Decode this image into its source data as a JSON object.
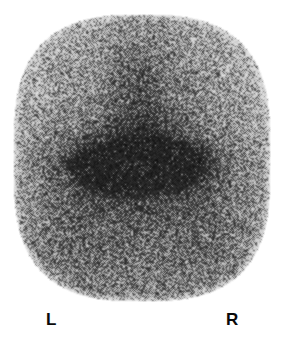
{
  "image": {
    "title": "Planar scintigram",
    "modality": "Nuclear medicine gamma camera scintigraphy",
    "colormap": "grayscale",
    "background_color": "#ffffff",
    "speckle_dark_color": "#0d0d0d",
    "speckle_light_color": "#f2f2f2",
    "width_px": 282,
    "height_px": 348
  },
  "field_of_view": {
    "shape": "rounded-oval",
    "left_px": 13,
    "top_px": 14,
    "right_px": 270,
    "bottom_px": 301,
    "top_edge": "flattened",
    "bottom_edge": "curved-arc"
  },
  "markers": {
    "left_label": "L",
    "right_label": "R"
  },
  "findings": {
    "hot_foci": [
      {
        "name": "left-focus",
        "center_x": 106,
        "center_y": 166,
        "radius_x": 28,
        "radius_y": 17,
        "intensity": 0.92
      },
      {
        "name": "right-focus",
        "center_x": 172,
        "center_y": 163,
        "radius_x": 26,
        "radius_y": 16,
        "intensity": 0.9
      }
    ],
    "midline_band": {
      "center_x": 140,
      "center_y": 110,
      "intensity": 0.45
    },
    "rim_attenuation": "peripheral counts reduced toward the field-of-view edge"
  },
  "chart_data": {
    "type": "heatmap",
    "xlabel": "",
    "ylabel": "",
    "grid": false,
    "legend": "none",
    "annotations": [
      "L",
      "R"
    ],
    "colorscale": {
      "low": "#f2f2f2",
      "high": "#0d0d0d"
    },
    "x_range": [
      0,
      282
    ],
    "y_range": [
      0,
      310
    ],
    "hotspots": [
      {
        "label": "left-focus",
        "x": 106,
        "y": 166,
        "value": 0.92
      },
      {
        "label": "right-focus",
        "x": 172,
        "y": 163,
        "value": 0.9
      },
      {
        "label": "midline-band",
        "x": 140,
        "y": 110,
        "value": 0.45
      }
    ],
    "background_value": 0.3
  }
}
